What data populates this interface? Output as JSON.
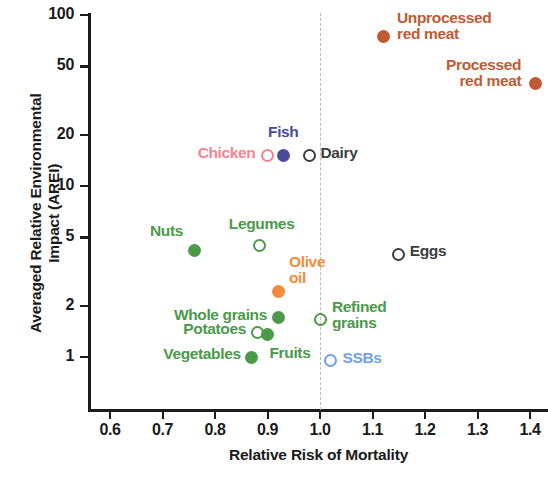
{
  "chart_data": {
    "type": "scatter",
    "title": "",
    "xlabel": "Relative Risk of Mortality",
    "ylabel": "Averaged Relative Environmental\nImpact (AREI)",
    "xlim": [
      0.555,
      1.46
    ],
    "ylim": [
      0.72,
      112
    ],
    "yscale": "log",
    "xticks": [
      "0.6",
      "0.7",
      "0.8",
      "0.9",
      "1.0",
      "1.1",
      "1.2",
      "1.3",
      "1.4"
    ],
    "xtick_values": [
      0.6,
      0.7,
      0.8,
      0.9,
      1.0,
      1.1,
      1.2,
      1.3,
      1.4
    ],
    "yticks": [
      "100",
      "50",
      "20",
      "10",
      "5",
      "2",
      "1"
    ],
    "ytick_values": [
      100,
      50,
      20,
      10,
      5,
      2,
      1
    ],
    "grid": false,
    "legend": "none (direct point labels)",
    "reference_line": {
      "axis": "x",
      "value": 1.0,
      "style": "dashed",
      "color": "#b9b9b9"
    },
    "points": [
      {
        "name": "Unprocessed red meat",
        "label": "Unprocessed\nred meat",
        "x": 1.12,
        "y": 75,
        "color": "#c05a34",
        "fill": "filled",
        "label_pos": "right"
      },
      {
        "name": "Processed red meat",
        "label": "Processed\nred meat",
        "x": 1.41,
        "y": 40,
        "color": "#c05a34",
        "fill": "filled",
        "label_pos": "left"
      },
      {
        "name": "Chicken",
        "label": "Chicken",
        "x": 0.9,
        "y": 15,
        "color": "#f4848f",
        "fill": "open",
        "label_pos": "left"
      },
      {
        "name": "Fish",
        "label": "Fish",
        "x": 0.93,
        "y": 15,
        "color": "#4a4a9c",
        "fill": "filled",
        "label_pos": "top"
      },
      {
        "name": "Dairy",
        "label": "Dairy",
        "x": 0.98,
        "y": 15,
        "color": "#3d3d3d",
        "fill": "open",
        "label_pos": "right"
      },
      {
        "name": "Eggs",
        "label": "Eggs",
        "x": 1.15,
        "y": 4.0,
        "color": "#3d3d3d",
        "fill": "open",
        "label_pos": "right"
      },
      {
        "name": "Nuts",
        "label": "Nuts",
        "x": 0.76,
        "y": 4.2,
        "color": "#4a9a4a",
        "fill": "filled",
        "label_pos": "left"
      },
      {
        "name": "Legumes",
        "label": "Legumes",
        "x": 0.885,
        "y": 4.5,
        "color": "#4a9a4a",
        "fill": "open",
        "label_pos": "top"
      },
      {
        "name": "Olive oil",
        "label": "Olive\noil",
        "x": 0.92,
        "y": 2.4,
        "color": "#f58a3c",
        "fill": "filled",
        "label_pos": "top"
      },
      {
        "name": "Whole grains",
        "label": "Whole grains",
        "x": 0.92,
        "y": 1.7,
        "color": "#4a9a4a",
        "fill": "filled",
        "label_pos": "left"
      },
      {
        "name": "Potatoes",
        "label": "Potatoes",
        "x": 0.88,
        "y": 1.4,
        "color": "#4a9a4a",
        "fill": "open",
        "label_pos": "left"
      },
      {
        "name": "Fruits",
        "label": "Fruits",
        "x": 0.9,
        "y": 1.35,
        "color": "#4a9a4a",
        "fill": "filled",
        "label_pos": "bottomright"
      },
      {
        "name": "Vegetables",
        "label": "Vegetables",
        "x": 0.87,
        "y": 1.0,
        "color": "#4a9a4a",
        "fill": "filled",
        "label_pos": "left"
      },
      {
        "name": "Refined grains",
        "label": "Refined\ngrains",
        "x": 1.0,
        "y": 1.65,
        "color": "#4a9a4a",
        "fill": "open",
        "label_pos": "right"
      },
      {
        "name": "SSBs",
        "label": "SSBs",
        "x": 1.02,
        "y": 0.95,
        "color": "#6f9fe8",
        "fill": "open",
        "label_pos": "right"
      }
    ]
  },
  "colors": {
    "axis": "#1c1c1c",
    "text": "#1a1a1a",
    "red_meat": "#c05a34",
    "chicken": "#f4848f",
    "fish": "#4a4a9c",
    "dairy_eggs": "#3d3d3d",
    "plant": "#4a9a4a",
    "olive_oil": "#f58a3c",
    "ssbs": "#6f9fe8",
    "refline": "#b9b9b9"
  }
}
